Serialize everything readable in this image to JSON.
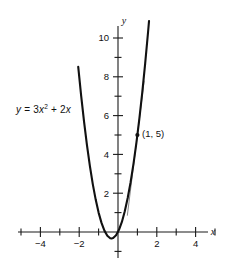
{
  "chart_data": {
    "type": "line",
    "title": "",
    "equation_label": "y = 3x² + 2x",
    "equation_parts": {
      "lhs": "y",
      "eq": "=",
      "coef": "3",
      "var1": "x",
      "exp": "2",
      "plus": "+",
      "coef2": "2",
      "var2": "x"
    },
    "xlabel": "x",
    "ylabel": "y",
    "xlim": [
      -5.2,
      5.2
    ],
    "ylim": [
      -1.6,
      10.9
    ],
    "grid": false,
    "legend": "none",
    "x_ticks_major": [
      -4,
      -2,
      2,
      4
    ],
    "x_ticks_minor": [
      -5,
      -3,
      -1,
      1,
      3,
      5
    ],
    "x_tick_labels": [
      "−4",
      "−2",
      "2",
      "4"
    ],
    "y_ticks_major": [
      2,
      4,
      6,
      8,
      10
    ],
    "y_ticks_minor": [
      -1,
      1,
      3,
      5,
      7,
      9
    ],
    "y_tick_labels": [
      "2",
      "4",
      "6",
      "8",
      "10"
    ],
    "series": [
      {
        "name": "y = 3x² + 2x",
        "type": "parabola",
        "coefficients": {
          "a": 3,
          "b": 2,
          "c": 0
        },
        "vertex": [
          -0.333,
          -0.333
        ],
        "x_range": [
          -2.05,
          1.72
        ],
        "points": [
          [
            -2.05,
            8.51
          ],
          [
            -1.9,
            7.03
          ],
          [
            -1.75,
            5.69
          ],
          [
            -1.6,
            4.48
          ],
          [
            -1.45,
            3.41
          ],
          [
            -1.3,
            2.47
          ],
          [
            -1.15,
            1.67
          ],
          [
            -1.0,
            1.0
          ],
          [
            -0.85,
            0.47
          ],
          [
            -0.7,
            0.07
          ],
          [
            -0.55,
            -0.19
          ],
          [
            -0.4,
            -0.32
          ],
          [
            -0.333,
            -0.333
          ],
          [
            -0.25,
            -0.31
          ],
          [
            -0.1,
            -0.17
          ],
          [
            0.05,
            0.11
          ],
          [
            0.2,
            0.52
          ],
          [
            0.35,
            1.07
          ],
          [
            0.5,
            1.75
          ],
          [
            0.65,
            2.57
          ],
          [
            0.8,
            3.52
          ],
          [
            0.95,
            4.61
          ],
          [
            1.1,
            5.83
          ],
          [
            1.25,
            7.19
          ],
          [
            1.4,
            8.68
          ],
          [
            1.55,
            10.31
          ],
          [
            1.6,
            10.88
          ]
        ]
      },
      {
        "name": "tangent-line",
        "type": "line",
        "slope": 8,
        "through": [
          1,
          5
        ],
        "x_range": [
          0.48,
          1.35
        ],
        "points": [
          [
            0.48,
            0.84
          ],
          [
            1.35,
            7.8
          ]
        ]
      }
    ],
    "annotations": [
      {
        "name": "point-1-5",
        "x": 1,
        "y": 5,
        "label": "(1, 5)",
        "marker": "dot"
      }
    ]
  },
  "labels": {
    "point_label": "(1, 5)",
    "x_axis": "x",
    "y_axis": "y"
  }
}
